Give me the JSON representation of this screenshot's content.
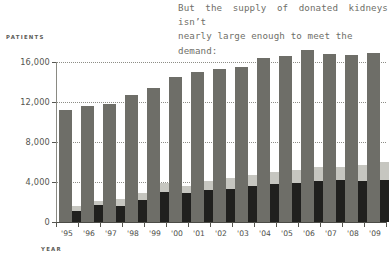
{
  "headline": {
    "line1": "But the supply of donated kidneys isn’t",
    "line2": "nearly large enough to meet the demand:"
  },
  "axes": {
    "y_title": "PATIENTS",
    "x_title": "YEAR"
  },
  "colors": {
    "waiting_list": "#6e6e68",
    "deceased_donor": "#20201e",
    "living_donor": "#c6c6c0",
    "gridline": "#8d8d86",
    "text": "#4e4e49",
    "headline_text": "#6f6f69"
  },
  "chart_data": {
    "type": "bar",
    "title": "But the supply of donated kidneys isn’t nearly large enough to meet the demand:",
    "xlabel": "YEAR",
    "ylabel": "PATIENTS",
    "ylim": [
      0,
      17600
    ],
    "grid": true,
    "gridlines": [
      0,
      4000,
      8000,
      12000,
      16000
    ],
    "ytick_labels": [
      "0",
      "4,000",
      "8,000",
      "12,000",
      "16,000"
    ],
    "legend_position": "none",
    "categories": [
      "'95",
      "'96",
      "'97",
      "'98",
      "'99",
      "'00",
      "'01",
      "'02",
      "'03",
      "'04",
      "'05",
      "'06",
      "'07",
      "'08",
      "'09"
    ],
    "series": [
      {
        "name": "Waiting list",
        "color": "#6e6e68",
        "values": [
          11200,
          11600,
          11800,
          12700,
          13400,
          14500,
          15000,
          15300,
          15500,
          16400,
          16600,
          17200,
          16800,
          16700,
          16900
        ]
      },
      {
        "name": "Deceased donor transplants",
        "color": "#20201e",
        "values": [
          1100,
          1700,
          1600,
          2200,
          3000,
          2900,
          3200,
          3300,
          3600,
          3800,
          3900,
          4100,
          4200,
          4100,
          4200
        ],
        "stacked": true
      },
      {
        "name": "Living donor transplants",
        "color": "#c6c6c0",
        "values": [
          500,
          400,
          700,
          700,
          900,
          700,
          900,
          1100,
          1100,
          1200,
          1300,
          1400,
          1300,
          1600,
          1800
        ],
        "stacked": true
      }
    ]
  }
}
